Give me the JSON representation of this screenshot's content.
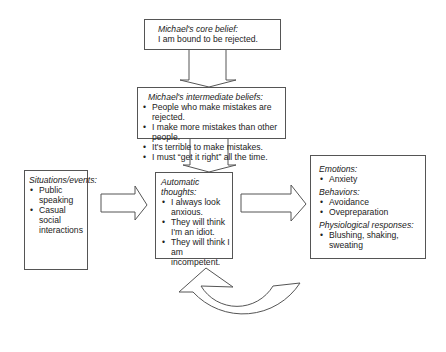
{
  "diagram": {
    "core_belief": {
      "title": "Michael's core belief:",
      "text": "I am bound to be rejected."
    },
    "intermediate_beliefs": {
      "title": "Michael's intermediate beliefs:",
      "items": [
        "People who make mistakes are rejected.",
        "I make more mistakes than other people.",
        "It's terrible to make mistakes.",
        "I must “get it right” all the time."
      ]
    },
    "situations": {
      "title": "Situations/events:",
      "items": [
        "Public speaking",
        "Casual social interactions"
      ]
    },
    "automatic_thoughts": {
      "title": "Automatic thoughts:",
      "items": [
        "I always look anxious.",
        "They will think I'm an idiot.",
        "They will think I am incompetent."
      ]
    },
    "reactions": {
      "emotions_title": "Emotions:",
      "emotions": [
        "Anxiety"
      ],
      "behaviors_title": "Behaviors:",
      "behaviors": [
        "Avoidance",
        "Ovepreparation"
      ],
      "physiological_title": "Physiological responses:",
      "physiological": [
        "Blushing, shaking, sweating"
      ]
    },
    "arrows": [
      {
        "name": "core-to-intermediate",
        "direction": "down"
      },
      {
        "name": "intermediate-to-automatic",
        "direction": "down"
      },
      {
        "name": "situations-to-automatic",
        "direction": "right"
      },
      {
        "name": "automatic-to-reactions",
        "direction": "right"
      },
      {
        "name": "feedback-loop",
        "direction": "curved-up"
      }
    ]
  }
}
